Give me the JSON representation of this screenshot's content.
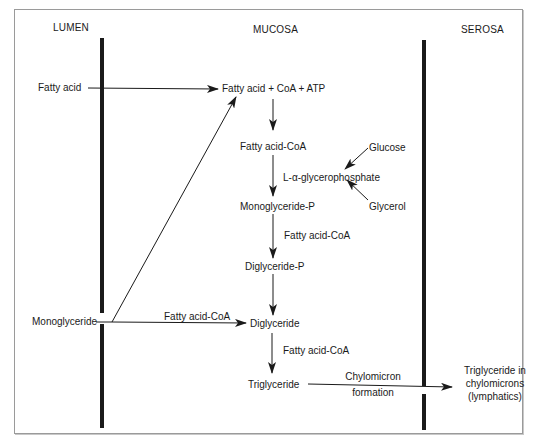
{
  "regions": {
    "lumen": "LUMEN",
    "mucosa": "MUCOSA",
    "serosa": "SEROSA"
  },
  "lumen_inputs": {
    "fatty_acid": "Fatty acid",
    "monoglyceride": "Monoglyceride"
  },
  "pathway": {
    "activation": "Fatty acid + CoA + ATP",
    "fatty_acid_coa": "Fatty acid-CoA",
    "glycerophosphate": "L-α-glycerophosphate",
    "glucose": "Glucose",
    "glycerol": "Glycerol",
    "monoglyceride_p": "Monoglyceride-P",
    "step_fatty_acid_coa_1": "Fatty acid-CoA",
    "diglyceride_p": "Diglyceride-P",
    "monoglyceride_path_label": "Fatty acid-CoA",
    "diglyceride": "Diglyceride",
    "step_fatty_acid_coa_2": "Fatty acid-CoA",
    "triglyceride": "Triglyceride",
    "chylomicron_line1": "Chylomicron",
    "chylomicron_line2": "formation",
    "output_line1": "Triglyceride in",
    "output_line2": "chylomicrons",
    "output_line3": "(lymphatics)"
  },
  "colors": {
    "ink": "#1a1a1a",
    "frame": "#9a9a9a",
    "background": "#ffffff"
  }
}
